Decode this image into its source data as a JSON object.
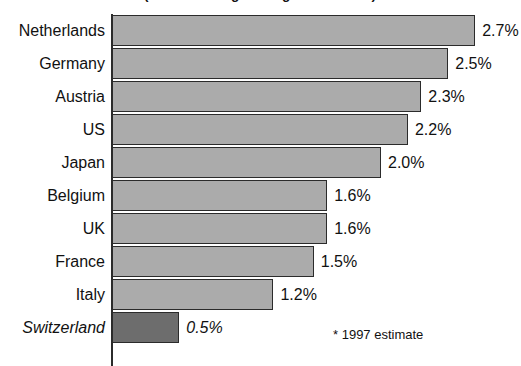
{
  "chart_data": {
    "type": "bar",
    "orientation": "horizontal",
    "title": "Real GDP Growth (annual average change 1993-1997*)",
    "xlabel": "",
    "ylabel": "",
    "xlim": [
      0,
      2.9
    ],
    "grid": false,
    "legend": null,
    "footnote": "* 1997 estimate",
    "value_suffix": "%",
    "categories": [
      "Netherlands",
      "Germany",
      "Austria",
      "US",
      "Japan",
      "Belgium",
      "UK",
      "France",
      "Italy",
      "Switzerland"
    ],
    "values": [
      2.7,
      2.5,
      2.3,
      2.2,
      2.0,
      1.6,
      1.6,
      1.5,
      1.2,
      0.5
    ],
    "value_labels": [
      "2.7%",
      "2.5%",
      "2.3%",
      "2.2%",
      "2.0%",
      "1.6%",
      "1.6%",
      "1.5%",
      "1.2%",
      "0.5%"
    ],
    "highlight_category": "Switzerland",
    "colors": {
      "bar": "#ababab",
      "bar_highlight": "#6d6d6d",
      "bar_outline": "#2b2b2b",
      "axis": "#2b2b2b",
      "text": "#111111",
      "background": "#ffffff"
    },
    "rows": [
      {
        "label": "Netherlands",
        "value": 2.7,
        "value_label": "2.7%",
        "highlight": false
      },
      {
        "label": "Germany",
        "value": 2.5,
        "value_label": "2.5%",
        "highlight": false
      },
      {
        "label": "Austria",
        "value": 2.3,
        "value_label": "2.3%",
        "highlight": false
      },
      {
        "label": "US",
        "value": 2.2,
        "value_label": "2.2%",
        "highlight": false
      },
      {
        "label": "Japan",
        "value": 2.0,
        "value_label": "2.0%",
        "highlight": false
      },
      {
        "label": "Belgium",
        "value": 1.6,
        "value_label": "1.6%",
        "highlight": false
      },
      {
        "label": "UK",
        "value": 1.6,
        "value_label": "1.6%",
        "highlight": false
      },
      {
        "label": "France",
        "value": 1.5,
        "value_label": "1.5%",
        "highlight": false
      },
      {
        "label": "Italy",
        "value": 1.2,
        "value_label": "1.2%",
        "highlight": false
      },
      {
        "label": "Switzerland",
        "value": 0.5,
        "value_label": "0.5%",
        "highlight": true
      }
    ]
  }
}
